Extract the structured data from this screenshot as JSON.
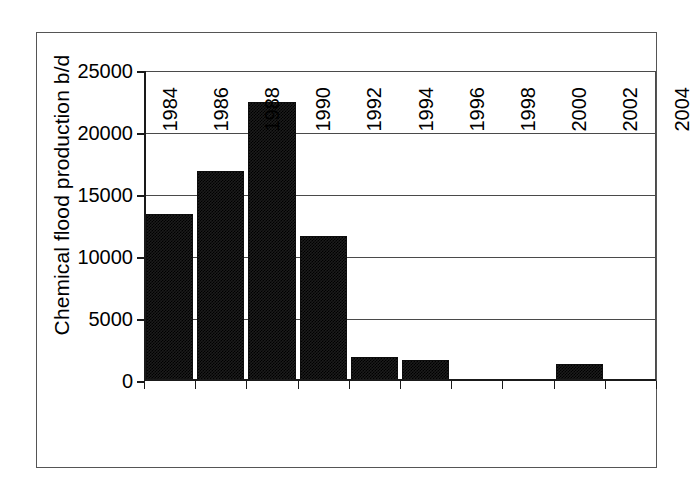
{
  "chart_data": {
    "type": "bar",
    "title": "",
    "xlabel": "",
    "ylabel": "Chemical flood production b/d",
    "categories": [
      "1984",
      "1986",
      "1988",
      "1990",
      "1992",
      "1994",
      "1996",
      "1998",
      "2000",
      "2002",
      "2004"
    ],
    "values": [
      13470,
      16940,
      22500,
      11700,
      1950,
      1700,
      180,
      180,
      1400,
      0,
      0
    ],
    "ylim": [
      0,
      25000
    ],
    "ytick_labels": [
      "0",
      "5000",
      "10000",
      "15000",
      "20000",
      "25000"
    ],
    "ytick_values": [
      0,
      5000,
      10000,
      15000,
      20000,
      25000
    ],
    "xtick_labels": [
      "1984",
      "1986",
      "1988",
      "1990",
      "1992",
      "1994",
      "1996",
      "1998",
      "2000",
      "2002",
      "2004"
    ],
    "grid": "horizontal",
    "legend": "none",
    "bar_color": "#1c1c1c",
    "axis_color": "#1a1a1a",
    "grid_color": "#4a4a4a",
    "background_color": "#ffffff"
  }
}
